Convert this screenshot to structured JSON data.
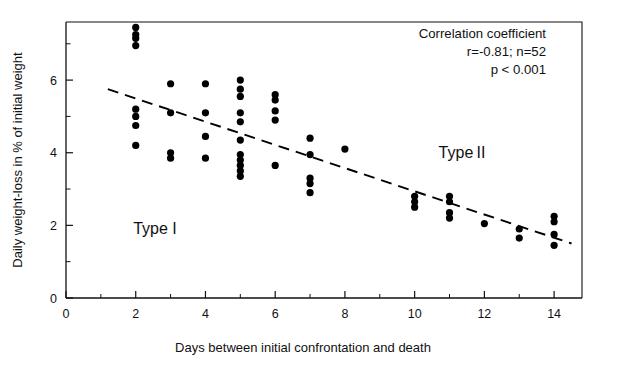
{
  "chart_data": {
    "type": "scatter",
    "title": "",
    "xlabel": "Days between initial confrontation and death",
    "ylabel": "Daily weight-loss in % of initial weight",
    "xlim": [
      0,
      14.8
    ],
    "ylim": [
      0,
      7.6
    ],
    "xticks": [
      0,
      2,
      4,
      6,
      8,
      10,
      12,
      14
    ],
    "xticklabels": [
      "0",
      "2",
      "4",
      "6",
      "8",
      "10",
      "12",
      "14"
    ],
    "xminorticks": [
      1,
      3,
      5,
      7,
      9,
      11,
      13
    ],
    "yticks": [
      0,
      2,
      4,
      6
    ],
    "yticklabels": [
      "0",
      "2",
      "4",
      "6"
    ],
    "yminorticks": [
      1,
      3,
      5,
      7
    ],
    "grid": false,
    "legend": "none",
    "points": [
      {
        "x": 2,
        "y": 7.45
      },
      {
        "x": 2,
        "y": 7.25
      },
      {
        "x": 2,
        "y": 7.15
      },
      {
        "x": 2,
        "y": 6.95
      },
      {
        "x": 2,
        "y": 5.2
      },
      {
        "x": 2,
        "y": 5.0
      },
      {
        "x": 2,
        "y": 4.75
      },
      {
        "x": 2,
        "y": 4.2
      },
      {
        "x": 3,
        "y": 5.9
      },
      {
        "x": 3,
        "y": 5.1
      },
      {
        "x": 3,
        "y": 4.0
      },
      {
        "x": 3,
        "y": 3.85
      },
      {
        "x": 4,
        "y": 5.9
      },
      {
        "x": 4,
        "y": 5.1
      },
      {
        "x": 4,
        "y": 4.45
      },
      {
        "x": 4,
        "y": 3.85
      },
      {
        "x": 5,
        "y": 6.0
      },
      {
        "x": 5,
        "y": 5.75
      },
      {
        "x": 5,
        "y": 5.55
      },
      {
        "x": 5,
        "y": 5.1
      },
      {
        "x": 5,
        "y": 4.85
      },
      {
        "x": 5,
        "y": 4.35
      },
      {
        "x": 5,
        "y": 3.95
      },
      {
        "x": 5,
        "y": 3.8
      },
      {
        "x": 5,
        "y": 3.65
      },
      {
        "x": 5,
        "y": 3.5
      },
      {
        "x": 5,
        "y": 3.35
      },
      {
        "x": 6,
        "y": 5.6
      },
      {
        "x": 6,
        "y": 5.45
      },
      {
        "x": 6,
        "y": 5.15
      },
      {
        "x": 6,
        "y": 4.9
      },
      {
        "x": 6,
        "y": 3.65
      },
      {
        "x": 7,
        "y": 4.4
      },
      {
        "x": 7,
        "y": 3.95
      },
      {
        "x": 7,
        "y": 3.3
      },
      {
        "x": 7,
        "y": 3.15
      },
      {
        "x": 7,
        "y": 2.9
      },
      {
        "x": 8,
        "y": 4.1
      },
      {
        "x": 10,
        "y": 2.8
      },
      {
        "x": 10,
        "y": 2.65
      },
      {
        "x": 10,
        "y": 2.5
      },
      {
        "x": 11,
        "y": 2.8
      },
      {
        "x": 11,
        "y": 2.65
      },
      {
        "x": 11,
        "y": 2.35
      },
      {
        "x": 11,
        "y": 2.2
      },
      {
        "x": 12,
        "y": 2.05
      },
      {
        "x": 13,
        "y": 1.9
      },
      {
        "x": 13,
        "y": 1.65
      },
      {
        "x": 14,
        "y": 2.25
      },
      {
        "x": 14,
        "y": 2.1
      },
      {
        "x": 14,
        "y": 1.75
      },
      {
        "x": 14,
        "y": 1.45
      }
    ],
    "fit_line": {
      "style": "dashed",
      "x_start": 1.2,
      "y_start": 5.75,
      "x_end": 14.5,
      "y_end": 1.5
    },
    "annotations": {
      "correlation_title": "Correlation coefficient",
      "correlation_stats": "r=-0.81;  n=52",
      "p_value": "p < 0.001",
      "type_one": "Type I",
      "type_two": "Type II"
    },
    "colors": {
      "point": "#000000",
      "line": "#000000",
      "axis": "#111111",
      "background": "#ffffff"
    }
  }
}
